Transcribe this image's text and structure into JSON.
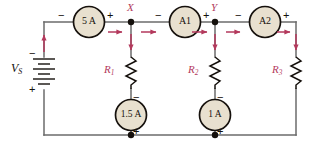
{
  "diagram": {
    "type": "electrical-schematic",
    "background_color": "#ffffff",
    "wire_color": "#6b6b6b",
    "arrow_color": "#b3395c",
    "label_color": "#b3395c",
    "meter_fill": "#e8e0cf",
    "meter_stroke": "#15100c"
  },
  "source": {
    "name": "voltage-source",
    "label": "V",
    "label_sub": "S",
    "polarity_top": "−",
    "polarity_bottom": "+"
  },
  "nodes": [
    {
      "name": "node-x",
      "label": "X"
    },
    {
      "name": "node-y",
      "label": "Y"
    }
  ],
  "meters": [
    {
      "name": "ammeter-5a",
      "label": "5 A",
      "terminal_left": "−",
      "terminal_right": "+",
      "orientation": "horizontal"
    },
    {
      "name": "ammeter-a1",
      "label": "A1",
      "terminal_left": "−",
      "terminal_right": "+",
      "orientation": "horizontal"
    },
    {
      "name": "ammeter-a2",
      "label": "A2",
      "terminal_left": "−",
      "terminal_right": "+",
      "orientation": "horizontal"
    },
    {
      "name": "ammeter-1p5a",
      "label": "1.5 A",
      "terminal_top": "−",
      "terminal_bottom": "+",
      "orientation": "vertical"
    },
    {
      "name": "ammeter-1a",
      "label": "1 A",
      "terminal_top": "−",
      "terminal_bottom": "+",
      "orientation": "vertical"
    }
  ],
  "resistors": [
    {
      "name": "resistor-r1",
      "label": "R",
      "label_sub": "1"
    },
    {
      "name": "resistor-r2",
      "label": "R",
      "label_sub": "2"
    },
    {
      "name": "resistor-r3",
      "label": "R",
      "label_sub": "3"
    }
  ],
  "current_arrows": [
    {
      "name": "current-arrow-source-up",
      "direction": "up"
    },
    {
      "name": "current-arrow-after-5a",
      "direction": "right"
    },
    {
      "name": "current-arrow-into-r1",
      "direction": "down"
    },
    {
      "name": "current-arrow-before-a1",
      "direction": "right"
    },
    {
      "name": "current-arrow-after-a1",
      "direction": "right"
    },
    {
      "name": "current-arrow-into-r2",
      "direction": "down"
    },
    {
      "name": "current-arrow-before-a2",
      "direction": "right"
    },
    {
      "name": "current-arrow-after-a2",
      "direction": "right"
    },
    {
      "name": "current-arrow-into-r3",
      "direction": "down"
    }
  ],
  "junctions": [
    {
      "name": "junction-node-x-top"
    },
    {
      "name": "junction-node-y-top"
    },
    {
      "name": "junction-r1-bottom"
    },
    {
      "name": "junction-r2-bottom"
    }
  ]
}
